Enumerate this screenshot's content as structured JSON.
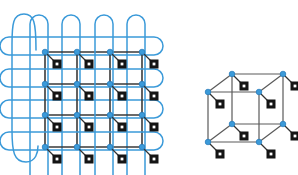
{
  "figure": {
    "background_color": "#ffffff",
    "width": 298,
    "height": 175,
    "panel_count": 2
  },
  "style": {
    "node_color": "#3b9ad9",
    "node_edge_color": "#2277b8",
    "node_radius": 2.8,
    "lattice_bond_color": "#3a3a3a",
    "cube_bond_color": "#5a5a5a",
    "loop_color": "#3b9ad9",
    "loop_stroke_width": 1.5,
    "tensor_square_color": "#141414",
    "tensor_square_inner_color": "#ffffff",
    "tensor_square_size": 9,
    "leg_color": "#333333",
    "leg_width": 1.3,
    "bond_width": 1.6
  },
  "panels": [
    {
      "id": "panel-left",
      "name": "square-lattice-panel",
      "label": "2D periodic square lattice with wrapping loops",
      "lattice": {
        "type": "square",
        "rows": 4,
        "cols": 4,
        "node_count": 16,
        "col_x": [
          45,
          77,
          110,
          142
        ],
        "row_y": [
          52,
          84,
          115,
          147
        ],
        "leg_direction": "down-right",
        "leg_length": 11,
        "square_offset_x": 12,
        "square_offset_y": 12
      },
      "loops": {
        "horizontal_count": 4,
        "vertical_count": 4,
        "outer_count": 1,
        "description": "Blue closed loops threading each lattice row and column, plus one large outer loop on the left",
        "horizontal_rx": 78,
        "horizontal_ry": 9,
        "vertical_rx": 9,
        "vertical_ry": 78
      }
    },
    {
      "id": "panel-right",
      "name": "cubic-lattice-panel",
      "label": "3D cubic lattice unit cell",
      "cube": {
        "type": "cube",
        "vertex_count": 8,
        "visible_faces": 3,
        "front_top_left": [
          208,
          92
        ],
        "front_top_right": [
          259,
          92
        ],
        "front_bottom_left": [
          208,
          142
        ],
        "front_bottom_right": [
          259,
          142
        ],
        "back_top_left": [
          232,
          74
        ],
        "back_top_right": [
          283,
          74
        ],
        "back_bottom_left": [
          232,
          124
        ],
        "back_bottom_right": [
          283,
          124
        ],
        "leg_direction": "down-right",
        "leg_length": 11,
        "square_offset_x": 12,
        "square_offset_y": 12
      }
    }
  ]
}
